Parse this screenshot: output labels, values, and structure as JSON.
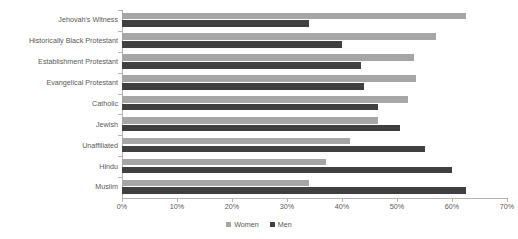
{
  "chart_data": {
    "type": "bar",
    "orientation": "horizontal",
    "title": "",
    "xlabel": "",
    "ylabel": "",
    "xlim": [
      0,
      70
    ],
    "xtick_labels": [
      "0%",
      "10%",
      "20%",
      "30%",
      "40%",
      "50%",
      "60%",
      "70%"
    ],
    "xtick_values": [
      0,
      10,
      20,
      30,
      40,
      50,
      60,
      70
    ],
    "grid": false,
    "legend_position": "bottom-center",
    "categories": [
      "Jehovah's Witness",
      "Historically Black Protestant",
      "Establishment Protestant",
      "Evangelical Protestant",
      "Catholic",
      "Jewish",
      "Unaffiliated",
      "Hindu",
      "Muslim"
    ],
    "series": [
      {
        "name": "Women",
        "color": "#a6a6a6",
        "values": [
          62.5,
          57.0,
          53.0,
          53.5,
          52.0,
          46.5,
          41.5,
          37.0,
          34.0
        ]
      },
      {
        "name": "Men",
        "color": "#404040",
        "values": [
          34.0,
          40.0,
          43.5,
          44.0,
          46.5,
          50.5,
          55.0,
          60.0,
          62.5
        ]
      }
    ],
    "legend": [
      "Women",
      "Men"
    ]
  },
  "axis": {
    "axis_color": "#b3b3b3",
    "text_color": "#595959"
  }
}
